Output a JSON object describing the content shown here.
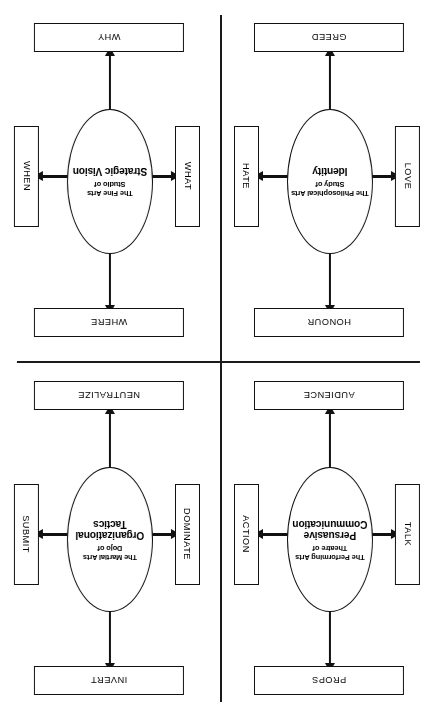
{
  "diagram": {
    "orientation": "rotated-180",
    "line_color": "#111111",
    "background_color": "#ffffff",
    "quadrants": [
      {
        "id": "performing-arts",
        "position": "top-left",
        "ellipse": {
          "prefix": "The Performing Arts\nTheatre of",
          "title": "Persuasive\nCommunication"
        },
        "boxes": {
          "top": "PROPS",
          "bottom": "AUDIENCE",
          "left": "TALK",
          "right": "ACTION"
        }
      },
      {
        "id": "martial-arts",
        "position": "top-right",
        "ellipse": {
          "prefix": "The Martial Arts\nDojo of",
          "title": "Organizational\nTactics"
        },
        "boxes": {
          "top": "INVERT",
          "bottom": "NEUTRALIZE",
          "left": "DOMINATE",
          "right": "SUBMIT"
        }
      },
      {
        "id": "philosophical-arts",
        "position": "bottom-left",
        "ellipse": {
          "prefix": "The Philosophical Arts\nStudy of",
          "title": "Identity"
        },
        "boxes": {
          "top": "HONOUR",
          "bottom": "GREED",
          "left": "LOVE",
          "right": "HATE"
        }
      },
      {
        "id": "fine-arts",
        "position": "bottom-right",
        "ellipse": {
          "prefix": "The Fine Arts\nStudio of",
          "title": "Strategic Vision"
        },
        "boxes": {
          "top": "WHERE",
          "bottom": "WHY",
          "left": "WHAT",
          "right": "WHEN"
        }
      }
    ]
  }
}
